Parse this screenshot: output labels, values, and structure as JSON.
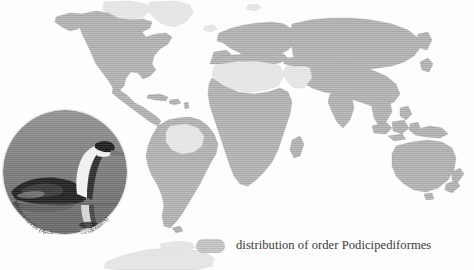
{
  "figure": {
    "kind": "distribution-map",
    "background_color": "#fdfdfd"
  },
  "map": {
    "name": "world-distribution-map",
    "projection": "equirectangular",
    "colors": {
      "distribution_fill": "#a9a9a9",
      "land_fill": "#d8d8d8",
      "land_stroke": "#c4c4c4",
      "ocean_fill": "#fdfdfd"
    },
    "regions_in_distribution": [
      "North America (contiguous, southern Canada, Mexico)",
      "Central America and Caribbean",
      "Andes and southern South America",
      "Europe",
      "North Africa coast",
      "Sub-Saharan and southern Africa",
      "Madagascar",
      "Russia and northern Asia",
      "Central, South and East Asia",
      "Southeast Asia and Indonesia",
      "New Guinea",
      "Australia",
      "New Zealand"
    ],
    "regions_excluded": [
      "Greenland and high Arctic",
      "Sahara Desert",
      "Arabian Peninsula interior",
      "Amazon Basin",
      "Antarctica"
    ]
  },
  "inset": {
    "name": "western-grebe-photo",
    "shape": "circle",
    "caption": "Western Grebe (Aechmophorus occidentalis)",
    "caption_common_name": "Western Grebe",
    "caption_scientific_name": "(Aechmophorus occidentalis)",
    "subject": "grebe swimming on water with reflection",
    "colors": {
      "water": "#7f7f7f",
      "bird_dark": "#1d1d1d",
      "bird_light": "#f2f2f2"
    }
  },
  "legend": {
    "name": "map-legend",
    "swatch_color": "#b9b9b9",
    "label": "distribution of order Podicipediformes"
  }
}
